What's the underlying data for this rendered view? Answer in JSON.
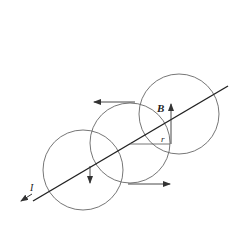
{
  "diagram": {
    "type": "physics-magnetic-field-around-current-wire",
    "labels": {
      "field": "B",
      "radius": "r",
      "current": "I"
    },
    "colors": {
      "stroke": "#333333",
      "circle": "#666666",
      "background": "#ffffff"
    },
    "wire": {
      "x1": 33,
      "y1": 201,
      "x2": 228,
      "y2": 86
    },
    "circles": [
      {
        "cx": 83,
        "cy": 170,
        "r": 40
      },
      {
        "cx": 130,
        "cy": 143,
        "r": 40
      },
      {
        "cx": 179,
        "cy": 114,
        "r": 40
      }
    ]
  }
}
